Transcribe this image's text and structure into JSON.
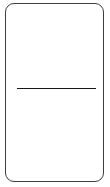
{
  "canvas": {
    "width": 110,
    "height": 187,
    "background_color": "#ffffff"
  },
  "card": {
    "name": "panel",
    "border_color": "#3a3f44",
    "fill_color": "#ffffff",
    "border_radius": "9px",
    "border_width": "1px",
    "label": "",
    "x": 5,
    "y": 3,
    "width": 99,
    "height": 179
  },
  "regions": {
    "top": {
      "label": "",
      "content": "",
      "height": 87
    },
    "bottom": {
      "label": "",
      "content": "",
      "height": 89
    }
  },
  "divider": {
    "name": "horizontal-rule",
    "color": "#15181b",
    "thickness": "1.5px",
    "x_start": 17,
    "x_end": 96,
    "y": 90,
    "label": ""
  }
}
